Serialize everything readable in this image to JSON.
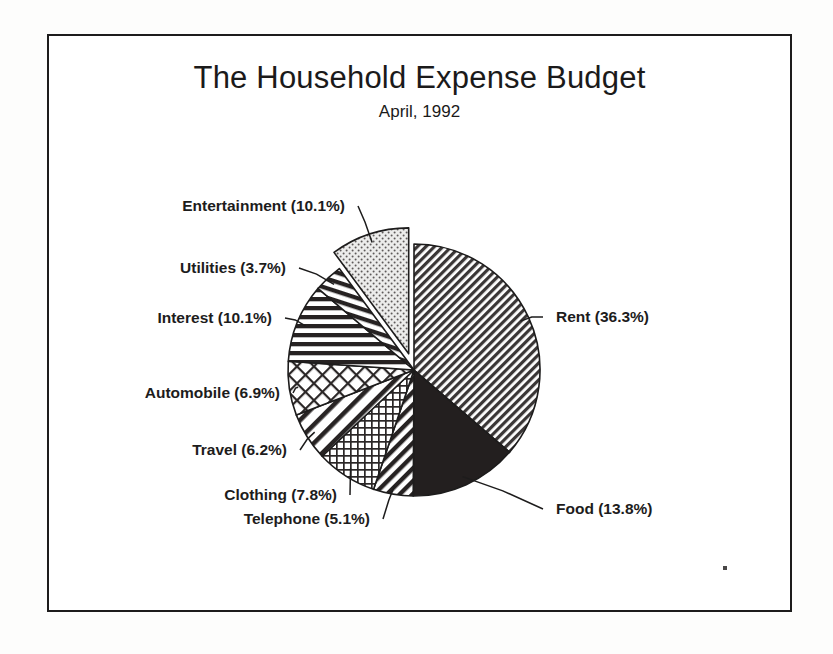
{
  "chart_data": {
    "type": "pie",
    "title": "The Household Expense Budget",
    "subtitle": "April, 1992",
    "xlabel": "",
    "ylabel": "",
    "legend_position": "none",
    "grid": false,
    "unit": "%",
    "start_angle_deg": 0,
    "direction": "clockwise",
    "categories": [
      "Rent",
      "Food",
      "Telephone",
      "Clothing",
      "Travel",
      "Automobile",
      "Interest",
      "Utilities",
      "Entertainment"
    ],
    "values": [
      36.3,
      13.8,
      5.1,
      7.8,
      6.2,
      6.9,
      10.1,
      3.7,
      10.1
    ],
    "labels": [
      "Rent (36.3%)",
      "Food (13.8%)",
      "Telephone (5.1%)",
      "Clothing (7.8%)",
      "Travel (6.2%)",
      "Automobile (6.9%)",
      "Interest (10.1%)",
      "Utilities (3.7%)",
      "Entertainment (10.1%)"
    ],
    "slices": [
      {
        "name": "Rent",
        "label": "Rent (36.3%)",
        "value": 36.3,
        "fill": "dense-diagonal-backslash",
        "exploded": false
      },
      {
        "name": "Food",
        "label": "Food (13.8%)",
        "value": 13.8,
        "fill": "solid-black",
        "exploded": false
      },
      {
        "name": "Telephone",
        "label": "Telephone (5.1%)",
        "value": 5.1,
        "fill": "diagonal-stripes",
        "exploded": false
      },
      {
        "name": "Clothing",
        "label": "Clothing (7.8%)",
        "value": 7.8,
        "fill": "fine-grid",
        "exploded": false
      },
      {
        "name": "Travel",
        "label": "Travel (6.2%)",
        "value": 6.2,
        "fill": "wide-diagonal-stripes",
        "exploded": false
      },
      {
        "name": "Automobile",
        "label": "Automobile (6.9%)",
        "value": 6.9,
        "fill": "diamond-crosshatch",
        "exploded": false
      },
      {
        "name": "Interest",
        "label": "Interest (10.1%)",
        "value": 10.1,
        "fill": "horizontal-stripes",
        "exploded": false
      },
      {
        "name": "Utilities",
        "label": "Utilities (3.7%)",
        "value": 3.7,
        "fill": "steep-diagonal-stripes",
        "exploded": false
      },
      {
        "name": "Entertainment",
        "label": "Entertainment (10.1%)",
        "value": 10.1,
        "fill": "dotted-stipple",
        "exploded": true
      }
    ],
    "colors": {
      "ink": "#1d1c1c",
      "paper": "#ffffff",
      "page": "#fdfdfc",
      "solid_slice": "#231f1f",
      "stipple_slice": "#e8e8e4"
    }
  }
}
